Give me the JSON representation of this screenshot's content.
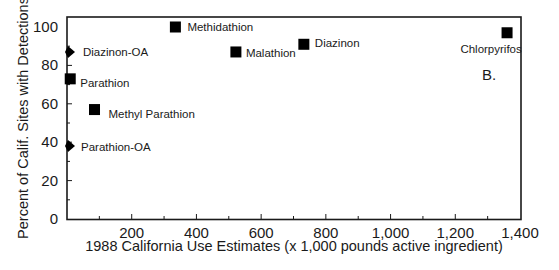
{
  "chart_data": {
    "type": "scatter",
    "title": "",
    "panel_label": "B.",
    "xlabel": "1988 California Use Estimates (x 1,000 pounds active ingredient)",
    "ylabel": "Percent of Calif. Sites with Detections",
    "xlim": [
      0,
      1400
    ],
    "ylim": [
      0,
      100
    ],
    "x_ticks": [
      200,
      400,
      600,
      800,
      1000,
      1200,
      1400
    ],
    "x_tick_labels": [
      "200",
      "400",
      "600",
      "800",
      "1,000",
      "1,200",
      "1,400"
    ],
    "y_ticks": [
      0,
      20,
      40,
      60,
      80,
      100
    ],
    "y_tick_labels": [
      "0",
      "20",
      "40",
      "60",
      "80",
      "100"
    ],
    "grid": false,
    "legend": "none (points labeled directly)",
    "points": [
      {
        "label": "Methidathion",
        "x": 335,
        "y": 100,
        "marker": "square"
      },
      {
        "label": "Malathion",
        "x": 522,
        "y": 87,
        "marker": "square"
      },
      {
        "label": "Diazinon",
        "x": 732,
        "y": 91,
        "marker": "square"
      },
      {
        "label": "Chlorpyrifos",
        "x": 1360,
        "y": 97,
        "marker": "square"
      },
      {
        "label": "Diazinon-OA",
        "x": 5,
        "y": 87,
        "marker": "diamond"
      },
      {
        "label": "Parathion",
        "x": 10,
        "y": 73,
        "marker": "square"
      },
      {
        "label": "Methyl Parathion",
        "x": 85,
        "y": 57,
        "marker": "square"
      },
      {
        "label": "Parathion-OA",
        "x": 5,
        "y": 38,
        "marker": "diamond"
      }
    ]
  },
  "colors": {
    "marker": "#000000",
    "axis": "#1a1a1a",
    "text": "#1a1a1a",
    "background": "#ffffff"
  }
}
